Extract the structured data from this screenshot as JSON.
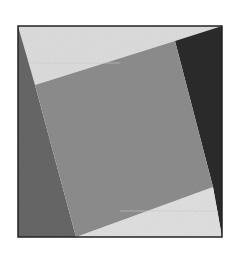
{
  "figure": {
    "colors": {
      "background": "#ffffff",
      "frame_border": "#222222",
      "inner_square": "#8d8d8d",
      "top_region": "#dddddd",
      "bottom_region": "#e0e0e0",
      "left_wedge": "#676767",
      "right_wedge": "#2b2b2b"
    },
    "regions": [
      {
        "name": "top-light-region",
        "shade": "light gray"
      },
      {
        "name": "right-dark-wedge",
        "shade": "near black"
      },
      {
        "name": "bottom-light-region",
        "shade": "light gray"
      },
      {
        "name": "left-dark-wedge",
        "shade": "dark gray"
      },
      {
        "name": "inner-tilted-square",
        "shade": "medium gray"
      }
    ]
  }
}
